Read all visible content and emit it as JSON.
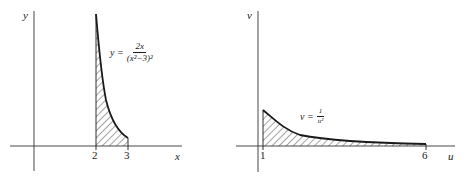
{
  "left_plot": {
    "y_axis_label": "y",
    "x_axis_label": "x",
    "ticks": [
      "2",
      "3"
    ],
    "equation": {
      "lhs": "y =",
      "numerator": "2x",
      "denominator": "(x²−3)²"
    },
    "shaded_interval": [
      2,
      3
    ]
  },
  "right_plot": {
    "y_axis_label": "v",
    "x_axis_label": "u",
    "ticks": [
      "1",
      "6"
    ],
    "equation": {
      "lhs": "v =",
      "numerator": "1",
      "denominator": "u²"
    },
    "shaded_interval": [
      1,
      6
    ]
  },
  "colors": {
    "ink": "#1a1a1a",
    "axis": "#333333",
    "background": "#ffffff"
  }
}
